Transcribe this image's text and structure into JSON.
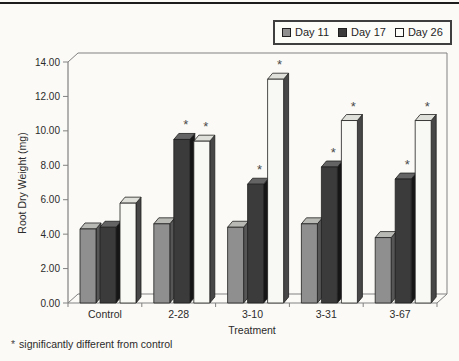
{
  "page": {
    "background": "#fbfaf6",
    "top_rule_color": "#1c1c1c"
  },
  "legend": {
    "position": "top-right",
    "items": [
      {
        "label": "Day 11",
        "fill": "#8f8f8f"
      },
      {
        "label": "Day 17",
        "fill": "#3b3b3b"
      },
      {
        "label": "Day 26",
        "fill": "#fcfcf9"
      }
    ]
  },
  "chart_data": {
    "type": "bar",
    "style": "3d-column",
    "title": "",
    "categories": [
      "Control",
      "2-28",
      "3-10",
      "3-31",
      "3-67"
    ],
    "series": [
      {
        "name": "Day 11",
        "values": [
          4.3,
          4.6,
          4.4,
          4.6,
          3.8
        ],
        "significant": [
          false,
          false,
          false,
          false,
          false
        ],
        "fill": "#8f8f8f",
        "top": "#b8b8b4",
        "side": "#565656"
      },
      {
        "name": "Day 17",
        "values": [
          4.4,
          9.5,
          6.9,
          7.9,
          7.2
        ],
        "significant": [
          false,
          true,
          true,
          true,
          true
        ],
        "fill": "#3b3b3b",
        "top": "#646464",
        "side": "#161616"
      },
      {
        "name": "Day 26",
        "values": [
          5.8,
          9.4,
          13.0,
          10.6,
          10.6
        ],
        "significant": [
          false,
          true,
          true,
          true,
          true
        ],
        "fill": "#f8f8f4",
        "top": "#e0e0da",
        "side": "#474747"
      }
    ],
    "xlabel": "Treatment",
    "ylabel": "Root Dry Weight (mg)",
    "ylim": [
      0,
      14
    ],
    "ytick_step": 2,
    "ytick_decimals": 2,
    "yticks": [
      "0.00",
      "2.00",
      "4.00",
      "6.00",
      "8.00",
      "10.00",
      "12.00",
      "14.00"
    ],
    "grid": false,
    "legend_position": "top-right",
    "significance_marker": "*"
  },
  "footnote": {
    "marker": "*",
    "text": "significantly different from control"
  }
}
